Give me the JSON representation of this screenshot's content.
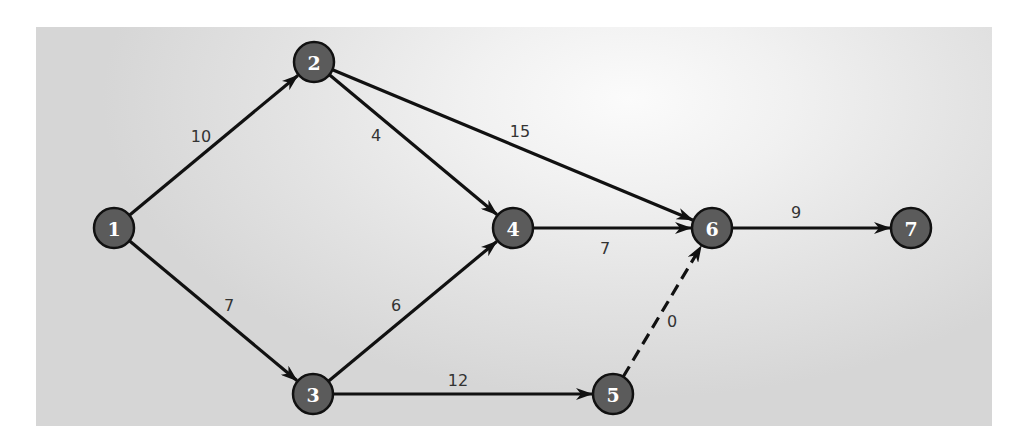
{
  "diagram": {
    "type": "directed-network",
    "colors": {
      "node_fill": "#5b5b5b",
      "node_stroke": "#111111",
      "node_text": "#ffffff",
      "edge": "#111111",
      "edge_label": "#333333",
      "background_light": "#fbfbfb",
      "background_dark": "#d6d6d6"
    },
    "nodes": [
      {
        "id": "1",
        "label": "1",
        "x": 114,
        "y": 228
      },
      {
        "id": "2",
        "label": "2",
        "x": 314,
        "y": 62
      },
      {
        "id": "3",
        "label": "3",
        "x": 313,
        "y": 394
      },
      {
        "id": "4",
        "label": "4",
        "x": 513,
        "y": 228
      },
      {
        "id": "5",
        "label": "5",
        "x": 613,
        "y": 394
      },
      {
        "id": "6",
        "label": "6",
        "x": 712,
        "y": 228
      },
      {
        "id": "7",
        "label": "7",
        "x": 911,
        "y": 228
      }
    ],
    "edges": [
      {
        "from": "1",
        "to": "2",
        "weight": "10",
        "style": "solid",
        "label_x": 201,
        "label_y": 136
      },
      {
        "from": "1",
        "to": "3",
        "weight": "7",
        "style": "solid",
        "label_x": 229,
        "label_y": 305
      },
      {
        "from": "2",
        "to": "4",
        "weight": "4",
        "style": "solid",
        "label_x": 376,
        "label_y": 135
      },
      {
        "from": "2",
        "to": "6",
        "weight": "15",
        "style": "solid",
        "label_x": 520,
        "label_y": 131
      },
      {
        "from": "3",
        "to": "4",
        "weight": "6",
        "style": "solid",
        "label_x": 396,
        "label_y": 305
      },
      {
        "from": "3",
        "to": "5",
        "weight": "12",
        "style": "solid",
        "label_x": 458,
        "label_y": 380
      },
      {
        "from": "4",
        "to": "6",
        "weight": "7",
        "style": "solid",
        "label_x": 605,
        "label_y": 248
      },
      {
        "from": "5",
        "to": "6",
        "weight": "0",
        "style": "dashed",
        "label_x": 672,
        "label_y": 321
      },
      {
        "from": "6",
        "to": "7",
        "weight": "9",
        "style": "solid",
        "label_x": 796,
        "label_y": 212
      }
    ]
  }
}
